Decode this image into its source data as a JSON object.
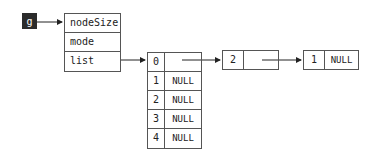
{
  "graph": {
    "pointer_label": "g",
    "struct_fields": [
      "nodeSize",
      "mode",
      "list"
    ],
    "array": {
      "rows": [
        {
          "index": "0",
          "value": ""
        },
        {
          "index": "1",
          "value": "NULL"
        },
        {
          "index": "2",
          "value": "NULL"
        },
        {
          "index": "3",
          "value": "NULL"
        },
        {
          "index": "4",
          "value": "NULL"
        }
      ]
    },
    "linked_nodes": [
      {
        "index": "2",
        "next": ""
      },
      {
        "index": "1",
        "next": "NULL"
      }
    ]
  }
}
